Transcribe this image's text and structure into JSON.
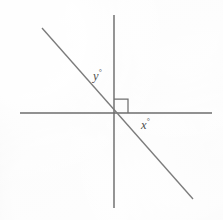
{
  "figure": {
    "kind": "geometry-angle-diagram",
    "background_color": "#f3f3f3",
    "axis_color": "#6c6c6c",
    "transversal_color": "#7b7b7b",
    "marker_color": "#6f6f6f",
    "label_color": "#4e4e4e"
  },
  "labels": {
    "angle_y": {
      "variable": "y",
      "unit": "°",
      "full": "y°"
    },
    "angle_x": {
      "variable": "x",
      "unit": "°",
      "full": "x°"
    }
  },
  "geometry": {
    "origin": {
      "x": 114,
      "y": 113
    },
    "horizontal_axis": {
      "x1": 20,
      "y1": 113,
      "x2": 212,
      "y2": 113
    },
    "vertical_axis": {
      "x1": 114,
      "y1": 15,
      "x2": 114,
      "y2": 208
    },
    "transversal": {
      "x1": 42,
      "y1": 28,
      "x2": 193,
      "y2": 199
    },
    "right_angle_marker": {
      "x": 114,
      "y": 99,
      "width": 14,
      "height": 14
    }
  }
}
